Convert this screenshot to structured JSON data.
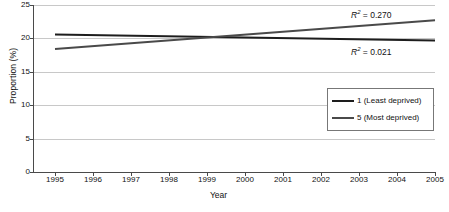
{
  "chart_data": {
    "type": "line",
    "title": "",
    "xlabel": "Year",
    "ylabel": "Proportion (%)",
    "xlim": [
      1995,
      2005
    ],
    "ylim": [
      0,
      25
    ],
    "x": [
      1995,
      2005
    ],
    "xticks": [
      "1995",
      "1996",
      "1997",
      "1998",
      "1999",
      "2000",
      "2001",
      "2002",
      "2003",
      "2004",
      "2005"
    ],
    "yticks": [
      "0",
      "5",
      "10",
      "15",
      "20",
      "25"
    ],
    "grid": "horizontal",
    "legend_position": "center-right",
    "series": [
      {
        "name": "1 (Least deprived)",
        "values": [
          20.6,
          19.7
        ],
        "color": "#1d1d1d",
        "r2": "0.021"
      },
      {
        "name": "5 (Most deprived)",
        "values": [
          18.4,
          22.7
        ],
        "color": "#4a4a4a",
        "r2": "0.270"
      }
    ],
    "annotations": [
      {
        "id": "r2-top",
        "prefix": "R",
        "exponent": "2",
        "suffix": " = 0.270",
        "series": "5 (Most deprived)"
      },
      {
        "id": "r2-bottom",
        "prefix": "R",
        "exponent": "2",
        "suffix": " = 0.021",
        "series": "1 (Least deprived)"
      }
    ]
  }
}
